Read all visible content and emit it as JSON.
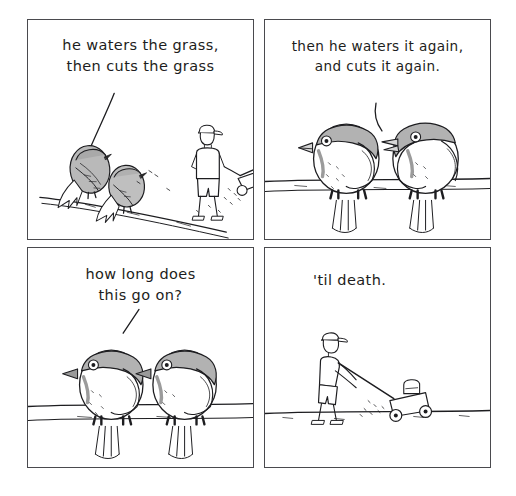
{
  "comic": {
    "title": "Birds watching a man mow the lawn",
    "layout": {
      "columns": 2,
      "rows": 2,
      "panel_count": 4
    },
    "style": {
      "background": "#ffffff",
      "ink": "#1d1d20",
      "border": "#4a4a4e",
      "bird_body_gray": "#b7b7b7",
      "bird_light": "#f2f2f2",
      "shade_gray": "#8d8d8d"
    },
    "panels": [
      {
        "index": 1,
        "caption": "he waters the grass,\nthen cuts the grass",
        "scene": "two birds perched on a diagonal branch at left, a man pushing a lawnmower at right",
        "speaker": "left bird",
        "pointer": "curved line from caption down to left bird"
      },
      {
        "index": 2,
        "caption": "then he waters it again,\nand cuts it again.",
        "scene": "two birds facing each other on a horizontal wire, tails hanging below",
        "speaker": "right bird",
        "pointer": "curved line from caption down to right bird"
      },
      {
        "index": 3,
        "caption": "how long does\nthis go on?",
        "scene": "two birds side by side on a horizontal wire, tails hanging below",
        "speaker": "left bird",
        "pointer": "short diagonal line from caption down to left bird"
      },
      {
        "index": 4,
        "caption": "'til death.",
        "scene": "man in a cap pushing a lawnmower across a flat ground line",
        "speaker": "narration",
        "pointer": "none"
      }
    ]
  }
}
